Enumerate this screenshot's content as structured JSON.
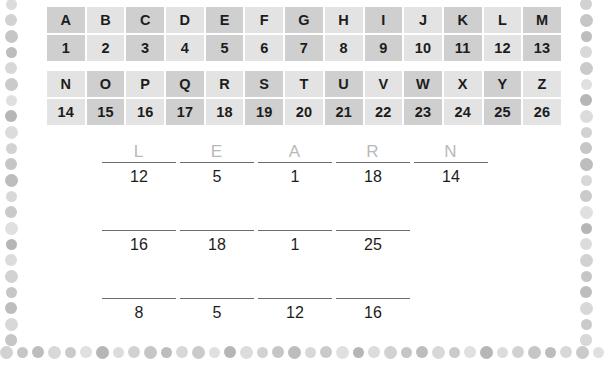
{
  "worksheet": {
    "title": "Letter-Number Cipher Worksheet",
    "border_style": "dotted-frame"
  },
  "cipher_table": {
    "caption": "A to Z letter value key",
    "rows": [
      {
        "name": "letters-a-m",
        "type": "letters",
        "cells": [
          "A",
          "B",
          "C",
          "D",
          "E",
          "F",
          "G",
          "H",
          "I",
          "J",
          "K",
          "L",
          "M"
        ],
        "shaded": [
          true,
          false,
          true,
          false,
          true,
          false,
          true,
          false,
          true,
          false,
          true,
          false,
          true
        ]
      },
      {
        "name": "numbers-1-13",
        "type": "numbers",
        "cells": [
          "1",
          "2",
          "3",
          "4",
          "5",
          "6",
          "7",
          "8",
          "9",
          "10",
          "11",
          "12",
          "13"
        ],
        "shaded": [
          true,
          false,
          true,
          false,
          true,
          false,
          true,
          false,
          true,
          false,
          true,
          false,
          true
        ]
      },
      {
        "name": "letters-n-z",
        "type": "letters",
        "cells": [
          "N",
          "O",
          "P",
          "Q",
          "R",
          "S",
          "T",
          "U",
          "V",
          "W",
          "X",
          "Y",
          "Z"
        ],
        "shaded": [
          false,
          true,
          false,
          true,
          false,
          true,
          false,
          true,
          false,
          true,
          false,
          true,
          false
        ]
      },
      {
        "name": "numbers-14-26",
        "type": "numbers",
        "cells": [
          "14",
          "15",
          "16",
          "17",
          "18",
          "19",
          "20",
          "21",
          "22",
          "23",
          "24",
          "25",
          "26"
        ],
        "shaded": [
          false,
          true,
          false,
          true,
          false,
          true,
          false,
          true,
          false,
          true,
          false,
          true,
          false
        ]
      }
    ]
  },
  "puzzle": {
    "rows": [
      {
        "name": "puzzle-row-1",
        "answer": "LEARN",
        "slots": [
          {
            "letter": "L",
            "number": "12"
          },
          {
            "letter": "E",
            "number": "5"
          },
          {
            "letter": "A",
            "number": "1"
          },
          {
            "letter": "R",
            "number": "18"
          },
          {
            "letter": "N",
            "number": "14"
          }
        ]
      },
      {
        "name": "puzzle-row-2",
        "answer": "",
        "slots": [
          {
            "letter": "",
            "number": "16"
          },
          {
            "letter": "",
            "number": "18"
          },
          {
            "letter": "",
            "number": "1"
          },
          {
            "letter": "",
            "number": "25"
          }
        ]
      },
      {
        "name": "puzzle-row-3",
        "answer": "",
        "slots": [
          {
            "letter": "",
            "number": "8"
          },
          {
            "letter": "",
            "number": "5"
          },
          {
            "letter": "",
            "number": "12"
          },
          {
            "letter": "",
            "number": "16"
          }
        ]
      }
    ]
  },
  "colors": {
    "cell_light": "#e3e3e3",
    "cell_dark": "#cfcfcf",
    "text": "#1c1c1c",
    "letter_faded": "#b9b9b9",
    "line": "#6e6e6e",
    "background": "#ffffff"
  }
}
